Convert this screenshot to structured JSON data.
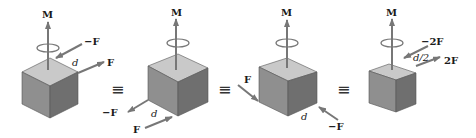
{
  "diagram": {
    "type": "equivalent-couples",
    "colors": {
      "cube_top": "#c9c9c9",
      "cube_left": "#8f8f8f",
      "cube_right": "#6f6f6f",
      "arrow": "#777777",
      "text": "#1a1a1a"
    },
    "equivalence_symbol": "≡",
    "panels": [
      {
        "moment_label": "M",
        "forces": [
          {
            "label": "−F",
            "direction": "toward top-back edge"
          },
          {
            "label": "F",
            "direction": "away from top-right edge"
          }
        ],
        "distance_label": "d"
      },
      {
        "moment_label": "M",
        "forces": [
          {
            "label": "−F",
            "direction": "away along bottom-left edge"
          },
          {
            "label": "F",
            "direction": "toward bottom-front corner"
          }
        ],
        "distance_label": "d"
      },
      {
        "moment_label": "M",
        "forces": [
          {
            "label": "F",
            "direction": "toward bottom-left corner"
          },
          {
            "label": "−F",
            "direction": "toward bottom-right corner"
          }
        ],
        "distance_label": "d"
      },
      {
        "moment_label": "M",
        "forces": [
          {
            "label": "−2F",
            "direction": "toward top edge"
          },
          {
            "label": "2F",
            "direction": "away from top edge"
          }
        ],
        "distance_label": "d/2"
      }
    ]
  }
}
